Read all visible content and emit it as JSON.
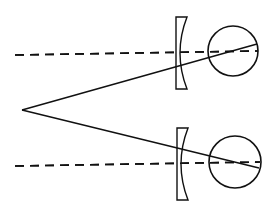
{
  "diagram": {
    "stroke_color": "#111111",
    "background": "#ffffff",
    "near_point": {
      "x": 22,
      "y": 110
    },
    "top": {
      "axis": {
        "x1": 15,
        "y1": 55,
        "x2": 258,
        "y2": 51
      },
      "sight_line": {
        "x1": 22,
        "y1": 110,
        "x2": 257,
        "y2": 44
      },
      "lens": {
        "x": 176,
        "top": 17,
        "bottom": 89,
        "top_w": 11,
        "mid_w": 4
      },
      "eye": {
        "cx": 233,
        "cy": 51,
        "r": 25
      }
    },
    "bottom": {
      "axis": {
        "x1": 15,
        "y1": 166,
        "x2": 260,
        "y2": 162
      },
      "sight_line": {
        "x1": 22,
        "y1": 110,
        "x2": 259,
        "y2": 168
      },
      "lens": {
        "x": 177,
        "top": 128,
        "bottom": 200,
        "top_w": 11,
        "mid_w": 4
      },
      "eye": {
        "cx": 235,
        "cy": 162,
        "r": 26
      }
    }
  }
}
